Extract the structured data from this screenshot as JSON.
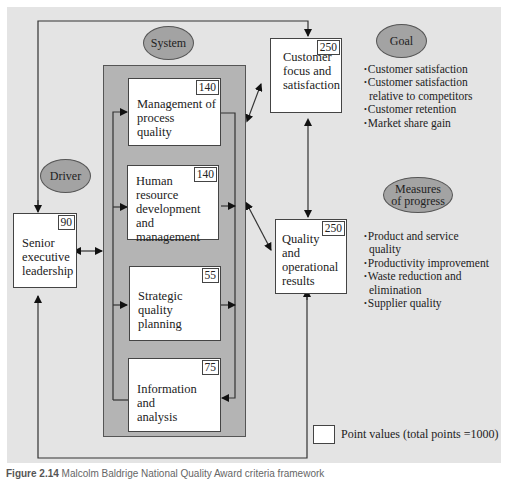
{
  "diagram": {
    "ellipses": {
      "system": "System",
      "driver": "Driver",
      "goal": "Goal",
      "measures_line1": "Measures",
      "measures_line2": "of progress"
    },
    "boxes": {
      "senior": {
        "lines": [
          "Senior",
          "executive",
          "leadership"
        ],
        "points": "90"
      },
      "process": {
        "lines": [
          "Management of",
          "process",
          "quality"
        ],
        "points": "140"
      },
      "human": {
        "lines": [
          "Human",
          "resource",
          "development",
          "and management"
        ],
        "points": "140"
      },
      "strategic": {
        "lines": [
          "Strategic",
          "quality",
          "planning"
        ],
        "points": "55"
      },
      "info": {
        "lines": [
          "Information",
          "and",
          "analysis"
        ],
        "points": "75"
      },
      "customer": {
        "lines": [
          "Customer",
          "focus and",
          "satisfaction"
        ],
        "points": "250"
      },
      "quality": {
        "lines": [
          "Quality",
          "and",
          "operational",
          "results"
        ],
        "points": "250"
      }
    },
    "goal_bullets": [
      "Customer satisfaction",
      "Customer satisfaction relative to competitors",
      "Customer retention",
      "Market share gain"
    ],
    "goal_bullet_lines": {
      "b1": "Customer satisfaction",
      "b2a": "Customer satisfaction",
      "b2b": "relative to competitors",
      "b3": "Customer retention",
      "b4": "Market share gain"
    },
    "measures_bullet_lines": {
      "b1a": "Product and service",
      "b1b": "quality",
      "b2": "Productivity improvement",
      "b3a": "Waste reduction and",
      "b3b": "elimination",
      "b4": "Supplier quality"
    },
    "legend": "Point values (total points =1000)"
  },
  "caption": {
    "label": "Figure 2.14",
    "text": "Malcolm Baldrige National Quality Award criteria framework"
  },
  "colors": {
    "panel": "#e4e4e4",
    "system_box": "#b4b4b4",
    "ellipse": "#a3a3a3",
    "box": "#ffffff",
    "line": "#333333"
  }
}
